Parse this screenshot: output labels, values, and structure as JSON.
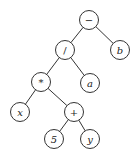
{
  "diagram": {
    "type": "expression-tree",
    "nodes": [
      {
        "id": "minus",
        "label": "−",
        "x": 89,
        "y": 20,
        "op": true
      },
      {
        "id": "div",
        "label": "/",
        "x": 65,
        "y": 50,
        "op": true
      },
      {
        "id": "b",
        "label": "b",
        "x": 120,
        "y": 50,
        "op": false
      },
      {
        "id": "mul",
        "label": "*",
        "x": 41,
        "y": 82,
        "op": true
      },
      {
        "id": "a",
        "label": "a",
        "x": 90,
        "y": 83,
        "op": false
      },
      {
        "id": "x",
        "label": "x",
        "x": 20,
        "y": 112,
        "op": false
      },
      {
        "id": "plus",
        "label": "+",
        "x": 74,
        "y": 112,
        "op": true
      },
      {
        "id": "five",
        "label": "5",
        "x": 54,
        "y": 139,
        "op": false
      },
      {
        "id": "y",
        "label": "y",
        "x": 90,
        "y": 139,
        "op": false
      }
    ],
    "edges": [
      [
        "minus",
        "div"
      ],
      [
        "minus",
        "b"
      ],
      [
        "div",
        "mul"
      ],
      [
        "div",
        "a"
      ],
      [
        "mul",
        "x"
      ],
      [
        "mul",
        "plus"
      ],
      [
        "plus",
        "five"
      ],
      [
        "plus",
        "y"
      ]
    ],
    "radius": 9.5
  }
}
